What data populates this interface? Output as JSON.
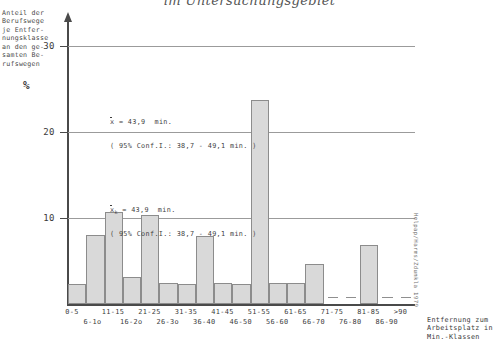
{
  "chart": {
    "title": "im Untersuchungsgebiet",
    "y_axis_caption": "Anteil der\nBerufswege\nje Entfer-\nnungsklasse\nan den ge-\nsamten Be-\nrufswegen",
    "y_axis_unit": "%",
    "x_axis_title": "Entfernung zum\nArbeitsplatz in\nMin.-Klassen",
    "source_credit": "Helpap/Harms/Zdunkla  1979"
  },
  "annotation": {
    "line1_symbol": "x",
    "line1_value": "= 43,9  min.",
    "line1_ci": "( 95% Conf.I.: 38,7 - 49,1 min. )",
    "line2_symbol": "x",
    "line2_subscript": "k",
    "line2_value": "= 43,9  min.",
    "line2_ci": "( 95% Conf.I.: 38,7 - 49,1 min. )"
  },
  "chart_data": {
    "type": "bar",
    "title": "im Untersuchungsgebiet",
    "xlabel": "Entfernung zum Arbeitsplatz in Min.-Klassen",
    "ylabel": "Anteil der Berufswege je Entfernungsklasse an den gesamten Berufswegen %",
    "ylim": [
      0,
      33
    ],
    "yticks": [
      10,
      20,
      30
    ],
    "ytick_labels": [
      "10",
      "20",
      "30"
    ],
    "grid": true,
    "legend": "none",
    "categories": [
      "0-5",
      "6-1o",
      "11-15",
      "16-2o",
      "21-25",
      "26-3o",
      "31-35",
      "36-40",
      "41-45",
      "46-50",
      "51-55",
      "56-60",
      "61-65",
      "66-70",
      "71-75",
      "76-80",
      "81-85",
      "86-90",
      ">90"
    ],
    "values": [
      2.3,
      8.0,
      10.7,
      3.1,
      10.4,
      2.4,
      2.3,
      7.9,
      2.4,
      2.3,
      23.7,
      2.4,
      2.4,
      4.6,
      0.0,
      0.0,
      6.9,
      0.0,
      0.0
    ],
    "tick_row": [
      0,
      1,
      0,
      1,
      0,
      1,
      0,
      1,
      0,
      1,
      0,
      1,
      0,
      1,
      0,
      1,
      0,
      1,
      0
    ]
  },
  "colors": {
    "bar_fill": "#d9d9d9",
    "bar_stroke": "#8c8c8c",
    "axis": "#4a4a4a",
    "grid": "#9b9b9b",
    "text": "#3a3a3a"
  }
}
